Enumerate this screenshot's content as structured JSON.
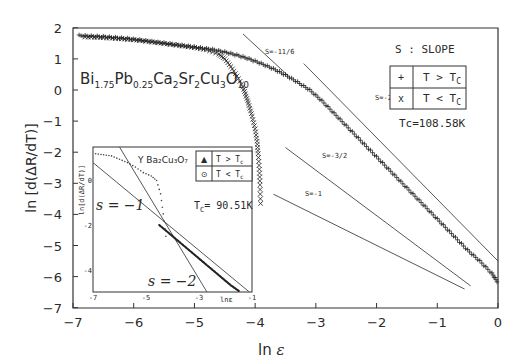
{
  "chart_data": [
    {
      "type": "scatter",
      "title": "",
      "compound_label": "Bi1.75Pb0.25Ca2Sr2Cu3O10",
      "xlabel": "ln ε",
      "ylabel": "ln [d(ΔR/dT)]",
      "xlim": [
        -7,
        0
      ],
      "ylim": [
        -7,
        2
      ],
      "xticks": [
        -7,
        -6,
        -5,
        -4,
        -3,
        -2,
        -1,
        0
      ],
      "yticks": [
        2,
        1,
        0,
        -1,
        -2,
        -3,
        -4,
        -5,
        -6,
        -7
      ],
      "grid": false,
      "legend_title": "S : SLOPE",
      "legend": [
        {
          "marker": "+",
          "label": "T > Tc"
        },
        {
          "marker": "x",
          "label": "T < Tc"
        }
      ],
      "annotation_tc": "Tc=108.58K",
      "series": [
        {
          "name": "T > Tc",
          "marker": "+",
          "x": [
            -6.9,
            -6.7,
            -6.5,
            -6.3,
            -6.1,
            -5.9,
            -5.7,
            -5.5,
            -5.3,
            -5.1,
            -4.9,
            -4.7,
            -4.5,
            -4.3,
            -4.1,
            -3.9,
            -3.7,
            -3.5,
            -3.3,
            -3.1,
            -2.9,
            -2.7,
            -2.5,
            -2.3,
            -2.1,
            -1.9,
            -1.7,
            -1.5,
            -1.3,
            -1.1,
            -0.9,
            -0.7,
            -0.5,
            -0.3,
            -0.1,
            0.0
          ],
          "y": [
            1.75,
            1.73,
            1.71,
            1.68,
            1.65,
            1.6,
            1.55,
            1.5,
            1.45,
            1.4,
            1.35,
            1.3,
            1.22,
            1.12,
            1.0,
            0.85,
            0.68,
            0.48,
            0.25,
            0.0,
            -0.35,
            -0.75,
            -1.15,
            -1.55,
            -1.95,
            -2.35,
            -2.75,
            -3.15,
            -3.55,
            -3.95,
            -4.35,
            -4.75,
            -5.15,
            -5.5,
            -5.9,
            -6.2
          ]
        },
        {
          "name": "T < Tc",
          "marker": "x",
          "x": [
            -6.8,
            -6.6,
            -6.4,
            -6.2,
            -6.0,
            -5.8,
            -5.6,
            -5.4,
            -5.2,
            -5.0,
            -4.8,
            -4.6,
            -4.5,
            -4.4,
            -4.3,
            -4.2,
            -4.15,
            -4.1,
            -4.05,
            -4.0,
            -3.97,
            -3.95,
            -3.93,
            -3.92,
            -3.91
          ],
          "y": [
            1.75,
            1.74,
            1.72,
            1.69,
            1.66,
            1.62,
            1.57,
            1.52,
            1.47,
            1.41,
            1.34,
            1.2,
            1.05,
            0.8,
            0.5,
            0.15,
            -0.15,
            -0.45,
            -0.8,
            -1.2,
            -1.6,
            -2.0,
            -2.5,
            -3.0,
            -3.6
          ]
        }
      ],
      "reference_lines": [
        {
          "label": "S=-11/6",
          "x": [
            -4.2,
            -3.45
          ],
          "y": [
            1.8,
            0.45
          ]
        },
        {
          "label": "S=-2",
          "x": [
            -3.2,
            0.0
          ],
          "y": [
            0.85,
            -5.5
          ]
        },
        {
          "label": "S=-3/2",
          "x": [
            -3.5,
            -0.45
          ],
          "y": [
            -1.85,
            -6.3
          ]
        },
        {
          "label": "S=-1",
          "x": [
            -3.7,
            -0.55
          ],
          "y": [
            -3.35,
            -6.4
          ]
        }
      ]
    },
    {
      "type": "scatter",
      "inset": true,
      "compound_label": "Y Ba2Cu3O7",
      "xlabel": "lnε",
      "ylabel": "ln[d(ΔR/dT)]",
      "xlim": [
        -7,
        -1
      ],
      "ylim": [
        -5,
        1.5
      ],
      "xticks": [
        -7,
        -5,
        -3,
        -1
      ],
      "yticks": [
        0,
        -2,
        -4
      ],
      "legend": [
        {
          "marker": "▲",
          "label": "T > Tc"
        },
        {
          "marker": "⊙",
          "label": "T < Tc"
        }
      ],
      "annotation_tc": "Tc= 90.51K",
      "series": [
        {
          "name": "T > Tc",
          "marker": "triangle",
          "x": [
            -4.5,
            -4.2,
            -3.9,
            -3.6,
            -3.3,
            -3.0,
            -2.7,
            -2.4,
            -2.1,
            -1.8,
            -1.5,
            -1.2
          ],
          "y": [
            -2.0,
            -2.3,
            -2.6,
            -2.9,
            -3.2,
            -3.5,
            -3.8,
            -4.1,
            -4.4,
            -4.7,
            -4.95,
            -5.0
          ]
        },
        {
          "name": "T < Tc",
          "marker": "circle-dot",
          "x": [
            -6.9,
            -6.6,
            -6.3,
            -6.0,
            -5.7,
            -5.4,
            -5.1,
            -4.8,
            -4.6,
            -4.45,
            -4.35,
            -4.25
          ],
          "y": [
            1.2,
            1.15,
            1.1,
            0.95,
            0.8,
            0.6,
            0.35,
            0.2,
            0.0,
            -0.6,
            -1.5,
            -2.5
          ]
        }
      ],
      "reference_lines": [
        {
          "label": "s = −1",
          "x": [
            -7.0,
            -1.1
          ],
          "y": [
            0.8,
            -5.0
          ]
        },
        {
          "label": "s = −2",
          "x": [
            -6.0,
            -2.7
          ],
          "y": [
            1.5,
            -5.0
          ]
        }
      ]
    }
  ],
  "labels": {
    "compound_main": "Bi",
    "legend_title": "S : SLOPE",
    "tc_main": "Tc=108.58K",
    "tc_inset_prefix": "T",
    "tc_inset_value": "= 90.51K",
    "inset_compound": "Y Ba₂Cu₃O₇",
    "inset_s1": "s = −1",
    "inset_s2": "s = −2"
  }
}
